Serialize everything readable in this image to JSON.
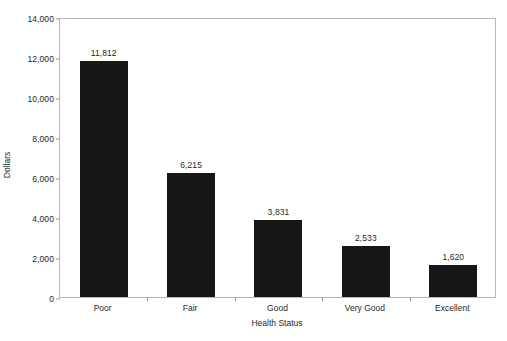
{
  "chart_data": {
    "type": "bar",
    "title": "",
    "xlabel": "Health Status",
    "ylabel": "Dollars",
    "categories": [
      "Poor",
      "Fair",
      "Good",
      "Very Good",
      "Excellent"
    ],
    "values": [
      11812,
      6215,
      3831,
      2533,
      1620
    ],
    "value_labels": [
      "11,812",
      "6,215",
      "3,831",
      "2,533",
      "1,620"
    ],
    "ylim": [
      0,
      14000
    ],
    "ytick_values": [
      0,
      2000,
      4000,
      6000,
      8000,
      10000,
      12000,
      14000
    ],
    "ytick_labels": [
      "0",
      "2,000",
      "4,000",
      "6,000",
      "8,000",
      "10,000",
      "12,000",
      "14,000"
    ],
    "grid": false,
    "legend": null,
    "bar_color": "#161616",
    "frame_color": "#b8b8b8",
    "background": "#ffffff"
  }
}
